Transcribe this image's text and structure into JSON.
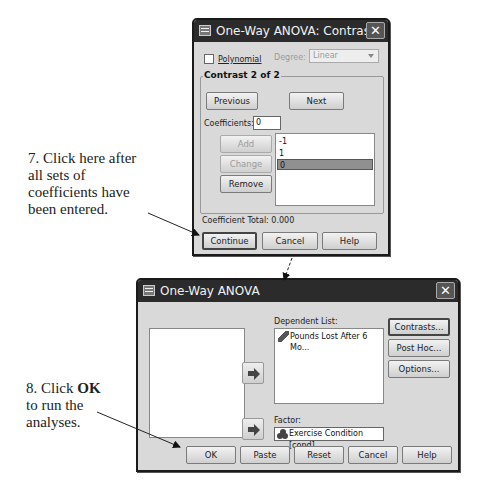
{
  "annotations": {
    "step7": [
      "7. Click here after",
      "all sets of",
      "coefficients have",
      "been entered."
    ],
    "step8_prefix": "8. Click ",
    "step8_bold": "OK",
    "step8_lines": [
      "to run the",
      "analyses."
    ]
  },
  "contrasts_dialog": {
    "title": "One-Way ANOVA: Contrasts",
    "close_label": "✕",
    "polynomial_label": "Polynomial",
    "polynomial_checked": false,
    "degree_label": "Degree:",
    "degree_value": "Linear",
    "group_title": "Contrast 2 of 2",
    "previous_label": "Previous",
    "next_label": "Next",
    "coefficients_label": "Coefficients:",
    "coefficients_value": "0",
    "add_label": "Add",
    "change_label": "Change",
    "remove_label": "Remove",
    "coefficient_list": [
      "-1",
      "1",
      "0"
    ],
    "selected_index": 2,
    "coefficient_total_label": "Coefficient Total:",
    "coefficient_total_value": "0.000",
    "continue_label": "Continue",
    "cancel_label": "Cancel",
    "help_label": "Help"
  },
  "anova_dialog": {
    "title": "One-Way ANOVA",
    "close_label": "✕",
    "dependent_list_label": "Dependent List:",
    "dependent_items": [
      "Pounds Lost After 6 Mo..."
    ],
    "factor_label": "Factor:",
    "factor_value": "Exercise Condition [cond]",
    "contrasts_label": "Contrasts...",
    "post_hoc_label": "Post Hoc...",
    "options_label": "Options...",
    "ok_label": "OK",
    "paste_label": "Paste",
    "reset_label": "Reset",
    "cancel_label": "Cancel",
    "help_label": "Help"
  }
}
